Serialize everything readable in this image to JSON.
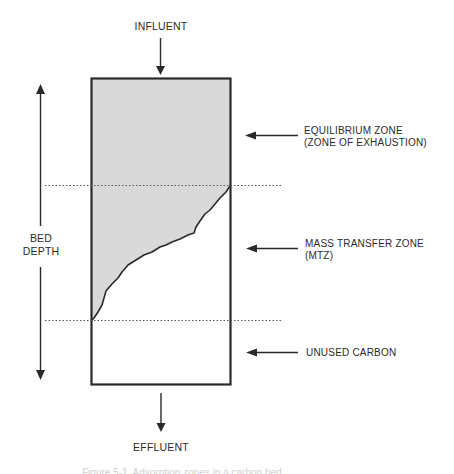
{
  "diagram": {
    "colors": {
      "line": "#2a2a2a",
      "exhausted_fill": "#d9d9d9",
      "dotted": "#555555",
      "background": "#ffffff"
    },
    "inlet": {
      "label": "INFLUENT"
    },
    "outlet": {
      "label": "EFFLUENT"
    },
    "bed_depth": {
      "line1": "BED",
      "line2": "DEPTH"
    },
    "zones": [
      {
        "id": "equilibrium",
        "line1": "EQUILIBRIUM ZONE",
        "line2": "(ZONE OF EXHAUSTION)"
      },
      {
        "id": "mtz",
        "line1": "MASS TRANSFER ZONE",
        "line2": "(MTZ)"
      },
      {
        "id": "unused",
        "line1": "UNUSED CARBON",
        "line2": ""
      }
    ],
    "caption": "Figure 5-1. Adsorption zones in a carbon bed"
  }
}
